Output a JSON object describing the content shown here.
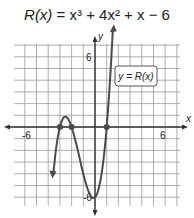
{
  "title": {
    "lhs": "R(x)",
    "rhs": "x³ + 4x² + x − 6"
  },
  "chart_data": {
    "type": "line",
    "xlabel": "x",
    "ylabel": "y",
    "xlim": [
      -7,
      6.5
    ],
    "ylim": [
      -7,
      7
    ],
    "grid": true,
    "tick_labels": {
      "x": [
        "-6",
        "6"
      ],
      "y": [
        "6",
        "-6"
      ]
    },
    "legend": {
      "label": "y = R(x)",
      "position": "upper right"
    },
    "function": "x^3 + 4x^2 + x - 6",
    "zeros": [
      -3,
      -2,
      1
    ],
    "points": [
      {
        "x": -3.6,
        "y": -7.3
      },
      {
        "x": -3,
        "y": 0
      },
      {
        "x": -2.5,
        "y": 0.9
      },
      {
        "x": -2,
        "y": 0
      },
      {
        "x": -1,
        "y": -4
      },
      {
        "x": -0.15,
        "y": -6.1
      },
      {
        "x": 0,
        "y": -6
      },
      {
        "x": 1,
        "y": 0
      },
      {
        "x": 1.6,
        "y": 7.3
      }
    ]
  },
  "labels": {
    "x_axis": "x",
    "y_axis": "y",
    "x_neg": "-6",
    "x_pos": "6",
    "y_pos": "6",
    "y_neg": "-6",
    "legend": "y = R(x)"
  },
  "colors": {
    "curve": "#4a4a4a",
    "grid": "#9a9a9a",
    "axis": "#333333"
  }
}
